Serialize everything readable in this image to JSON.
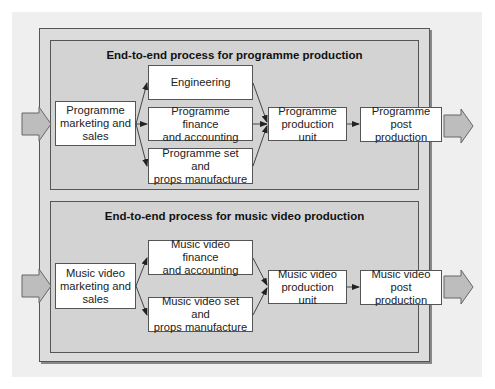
{
  "diagram": {
    "top_panel": {
      "title": "End-to-end process for programme production",
      "boxes": {
        "marketing": "Programme\nmarketing and\nsales",
        "engineering": "Engineering",
        "finance": "Programme finance\nand accounting",
        "set_props": "Programme set and\nprops manufacture",
        "production_unit": "Programme\nproduction unit",
        "post_production": "Programme\npost production"
      }
    },
    "bottom_panel": {
      "title": "End-to-end process for music video production",
      "boxes": {
        "marketing": "Music video\nmarketing and\nsales",
        "finance": "Music video finance\nand accounting",
        "set_props": "Music video set and\nprops manufacture",
        "production_unit": "Music video\nproduction unit",
        "post_production": "Music video\npost production"
      }
    },
    "colors": {
      "outer_frame": "#dcdcdc",
      "panel": "#d3d3d3",
      "box": "#ffffff",
      "border": "#555555",
      "io_arrow": "#bdbdbd"
    }
  }
}
